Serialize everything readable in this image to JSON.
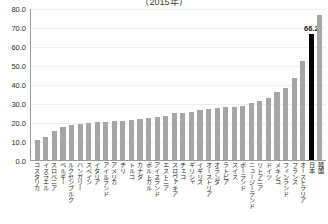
{
  "chart_data": {
    "type": "bar",
    "title": "（2015年）",
    "xlabel": "",
    "ylabel": "",
    "ylim": [
      0,
      80
    ],
    "ytick_labels": [
      "80.0",
      "70.0",
      "60.0",
      "50.0",
      "40.0",
      "30.0",
      "20.0",
      "10.0",
      "0.0"
    ],
    "ytick_values": [
      80,
      70,
      60,
      50,
      40,
      30,
      20,
      10,
      0
    ],
    "grid": true,
    "legend": "none",
    "highlight_category": "日本",
    "highlight_value": 66.2,
    "highlight_label": "66.2",
    "bar_color": "#a6a6a6",
    "highlight_color": "#000000",
    "categories": [
      "コスタリカ",
      "イスラエル",
      "スロベニア",
      "ベルギー",
      "ルクセンブルク",
      "ハンガリー",
      "スペイン",
      "イタリア",
      "アイルランド",
      "アメリカ",
      "チリ",
      "トルコ",
      "カナダ",
      "ポルトガル",
      "アイスランド",
      "エストニア",
      "スロヴァキア",
      "チェコ",
      "ギリシャ",
      "イギリス",
      "オーストリア",
      "オランダ",
      "ラトビア",
      "スイス",
      "ポーランド",
      "ニュージーランド",
      "リトアニア",
      "ドイツ",
      "メキシコ",
      "フィンランド",
      "フランス",
      "オーストラリア",
      "日本",
      "韓国"
    ],
    "values": [
      10.5,
      12.0,
      15.5,
      17.5,
      18.5,
      19.0,
      19.5,
      20.0,
      20.0,
      20.5,
      20.5,
      21.0,
      21.5,
      22.0,
      22.5,
      23.0,
      24.5,
      25.0,
      25.5,
      26.5,
      27.0,
      27.5,
      28.0,
      28.0,
      28.5,
      30.0,
      31.0,
      32.5,
      36.0,
      38.0,
      43.0,
      52.0,
      66.2,
      76.5
    ]
  }
}
